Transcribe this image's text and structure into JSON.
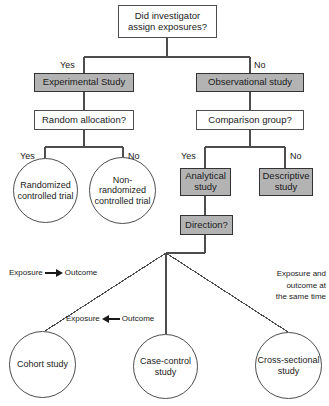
{
  "diagram": {
    "colors": {
      "shaded_fill": "#b3b3b3",
      "stroke": "#4d4d4d",
      "text": "#1a1a1a",
      "background": "#ffffff"
    },
    "nodes": {
      "root_question": "Did investigator assign exposures?",
      "experimental_study": "Experimental Study",
      "observational_study": "Observational study",
      "random_allocation": "Random allocation?",
      "comparison_group": "Comparison group?",
      "randomized_controlled_trial": "Randomized controlled trial",
      "non_randomized_controlled_trial": "Non-randomized controlled trial",
      "analytical_study": "Analytical study",
      "descriptive_study": "Descriptive study",
      "direction": "Direction?",
      "cohort_study": "Cohort study",
      "case_control_study": "Case-control study",
      "cross_sectional_study": "Cross-sectional study"
    },
    "branch_labels": {
      "root_yes": "Yes",
      "root_no": "No",
      "random_allocation_yes": "Yes",
      "random_allocation_no": "No",
      "comparison_group_yes": "Yes",
      "comparison_group_no": "No"
    },
    "direction_labels": {
      "cohort": {
        "from": "Exposure",
        "to": "Outcome",
        "arrow": "arrow-right-icon"
      },
      "case_control": {
        "from": "Exposure",
        "to": "Outcome",
        "arrow": "arrow-left-icon"
      },
      "cross_sectional": {
        "line1": "Exposure and",
        "line2": "outcome at",
        "line3": "the same time"
      }
    }
  }
}
